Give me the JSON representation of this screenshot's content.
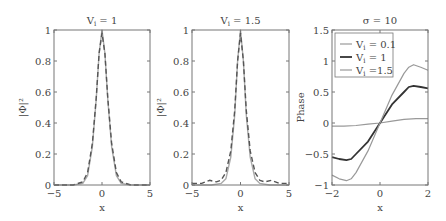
{
  "chart_data": [
    {
      "type": "line",
      "title": "V_i = 1",
      "xlabel": "x",
      "ylabel": "|Φ|²",
      "xlim": [
        -5,
        5
      ],
      "ylim": [
        0,
        1
      ],
      "xticks": [
        "-5",
        "0",
        "5"
      ],
      "yticks": [
        "0",
        "0.2",
        "0.4",
        "0.6",
        "0.8",
        "1"
      ],
      "grid": false,
      "series": [
        {
          "name": "solid",
          "style": "solid",
          "color": "#aaaaaa",
          "x": [
            -5,
            -3,
            -2,
            -1.5,
            -1,
            -0.6,
            -0.3,
            0,
            0.3,
            0.6,
            1,
            1.5,
            2,
            3,
            5
          ],
          "y": [
            0,
            0,
            0.01,
            0.06,
            0.25,
            0.55,
            0.85,
            1,
            0.85,
            0.55,
            0.25,
            0.06,
            0.01,
            0,
            0
          ]
        },
        {
          "name": "dashed",
          "style": "dashed",
          "color": "#555555",
          "x": [
            -5,
            -3,
            -2,
            -1.5,
            -1,
            -0.6,
            -0.3,
            0,
            0.3,
            0.6,
            1,
            1.5,
            2,
            3,
            5
          ],
          "y": [
            0,
            0,
            0.02,
            0.08,
            0.27,
            0.56,
            0.85,
            0.98,
            0.85,
            0.56,
            0.27,
            0.08,
            0.02,
            0,
            0
          ]
        }
      ]
    },
    {
      "type": "line",
      "title": "V_i = 1.5",
      "xlabel": "x",
      "ylabel": "|Φ|²",
      "xlim": [
        -5,
        5
      ],
      "ylim": [
        0,
        1
      ],
      "xticks": [
        "-5",
        "0",
        "5"
      ],
      "yticks": [
        "0",
        "0.2",
        "0.4",
        "0.6",
        "0.8",
        "1"
      ],
      "grid": false,
      "series": [
        {
          "name": "solid",
          "style": "solid",
          "color": "#aaaaaa",
          "x": [
            -5,
            -3,
            -2,
            -1.5,
            -1,
            -0.6,
            -0.3,
            0,
            0.3,
            0.6,
            1,
            1.5,
            2,
            3,
            5
          ],
          "y": [
            0,
            0,
            0.01,
            0.04,
            0.18,
            0.45,
            0.8,
            1,
            0.8,
            0.45,
            0.18,
            0.04,
            0.01,
            0,
            0
          ]
        },
        {
          "name": "dashed",
          "style": "dashed",
          "color": "#555555",
          "x": [
            -5,
            -4,
            -3.2,
            -2.5,
            -2,
            -1.5,
            -1,
            -0.6,
            -0.3,
            0,
            0.3,
            0.6,
            1,
            1.5,
            2,
            2.5,
            3.2,
            4,
            5
          ],
          "y": [
            0.01,
            0.01,
            0.03,
            0.02,
            0.03,
            0.08,
            0.22,
            0.48,
            0.8,
            0.98,
            0.8,
            0.48,
            0.22,
            0.08,
            0.03,
            0.02,
            0.03,
            0.01,
            0.01
          ]
        }
      ]
    },
    {
      "type": "line",
      "title": "σ = 10",
      "xlabel": "x",
      "ylabel": "Phase",
      "xlim": [
        -2,
        2
      ],
      "ylim": [
        -1,
        1.5
      ],
      "xticks": [
        "-2",
        "0",
        "2"
      ],
      "yticks": [
        "-1",
        "-0.5",
        "0",
        "0.5",
        "1",
        "1.5"
      ],
      "grid": false,
      "legend": {
        "position": "upper left",
        "entries": [
          "V_i = 0.1",
          "V_i = 1",
          "V_i =1.5"
        ]
      },
      "series": [
        {
          "name": "V_i = 0.1",
          "color": "#999999",
          "width": 1.2,
          "x": [
            -2,
            -1.5,
            -1,
            -0.5,
            0,
            0.5,
            1,
            1.5,
            2
          ],
          "y": [
            -0.05,
            -0.05,
            -0.04,
            -0.02,
            0,
            0.03,
            0.06,
            0.07,
            0.07
          ]
        },
        {
          "name": "V_i = 1",
          "color": "#333333",
          "width": 1.8,
          "x": [
            -2,
            -1.7,
            -1.4,
            -1.2,
            -1,
            -0.5,
            0,
            0.5,
            1,
            1.2,
            1.4,
            1.7,
            2
          ],
          "y": [
            -0.55,
            -0.58,
            -0.6,
            -0.58,
            -0.5,
            -0.3,
            0,
            0.3,
            0.5,
            0.58,
            0.6,
            0.58,
            0.56
          ]
        },
        {
          "name": "V_i =1.5",
          "color": "#999999",
          "width": 1.2,
          "x": [
            -2,
            -1.7,
            -1.4,
            -1.2,
            -1,
            -0.5,
            0,
            0.5,
            1,
            1.2,
            1.4,
            1.7,
            2
          ],
          "y": [
            -0.84,
            -0.9,
            -0.93,
            -0.9,
            -0.8,
            -0.45,
            0,
            0.45,
            0.8,
            0.9,
            0.94,
            0.9,
            0.85
          ]
        }
      ]
    }
  ],
  "panels": [
    {
      "title_main": "V",
      "title_sub": "i",
      "title_rest": " = 1",
      "ylabel": "|Φ|²",
      "xlabel": "x"
    },
    {
      "title_main": "V",
      "title_sub": "i",
      "title_rest": " = 1.5",
      "ylabel": "|Φ|²",
      "xlabel": "x"
    },
    {
      "title_main": "σ = 10",
      "ylabel": "Phase",
      "xlabel": "x",
      "legend": [
        {
          "main": "V",
          "sub": "i",
          "rest": " = 0.1"
        },
        {
          "main": "V",
          "sub": "i",
          "rest": " = 1"
        },
        {
          "main": "V",
          "sub": "i",
          "rest": " =1.5"
        }
      ]
    }
  ]
}
